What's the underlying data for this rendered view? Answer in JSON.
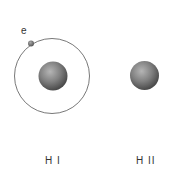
{
  "diagram": {
    "electron_label": "e",
    "atoms": [
      {
        "label": "H I",
        "description": "neutral hydrogen: proton with orbiting electron"
      },
      {
        "label": "H II",
        "description": "ionized hydrogen: bare proton"
      }
    ],
    "colors": {
      "orbit": "#555555",
      "nucleus": "#7a7a7a",
      "background": "#ffffff"
    }
  }
}
